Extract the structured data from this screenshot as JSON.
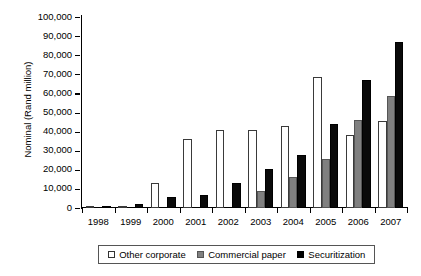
{
  "chart_data": {
    "type": "bar",
    "title": "",
    "xlabel": "",
    "ylabel": "Nominal (Rand million)",
    "categories": [
      "1998",
      "1999",
      "2000",
      "2001",
      "2002",
      "2003",
      "2004",
      "2005",
      "2006",
      "2007"
    ],
    "series": [
      {
        "name": "Other corporate",
        "color": "#ffffff",
        "values": [
          700,
          900,
          13000,
          36000,
          41000,
          41000,
          43000,
          68500,
          38000,
          45500
        ]
      },
      {
        "name": "Commercial paper",
        "color": "#808080",
        "values": [
          0,
          0,
          0,
          0,
          0,
          9000,
          16500,
          25500,
          46000,
          58500
        ]
      },
      {
        "name": "Securitization",
        "color": "#000000",
        "values": [
          900,
          2000,
          6000,
          7000,
          13000,
          20500,
          28000,
          44000,
          67000,
          87000
        ]
      }
    ],
    "ylim": [
      0,
      100000
    ],
    "ytick_values": [
      0,
      10000,
      20000,
      30000,
      40000,
      50000,
      60000,
      70000,
      80000,
      90000,
      100000
    ],
    "ytick_labels": [
      "0",
      "10,000",
      "20,000",
      "30,000",
      "40,000",
      "50,000",
      "60,000",
      "70,000",
      "80,000",
      "90,000",
      "100,000"
    ],
    "grid": false,
    "legend_position": "bottom"
  },
  "legend": {
    "entries": [
      {
        "label": "Other corporate",
        "swatch": "other"
      },
      {
        "label": "Commercial paper",
        "swatch": "commercial"
      },
      {
        "label": "Securitization",
        "swatch": "secur"
      }
    ]
  }
}
